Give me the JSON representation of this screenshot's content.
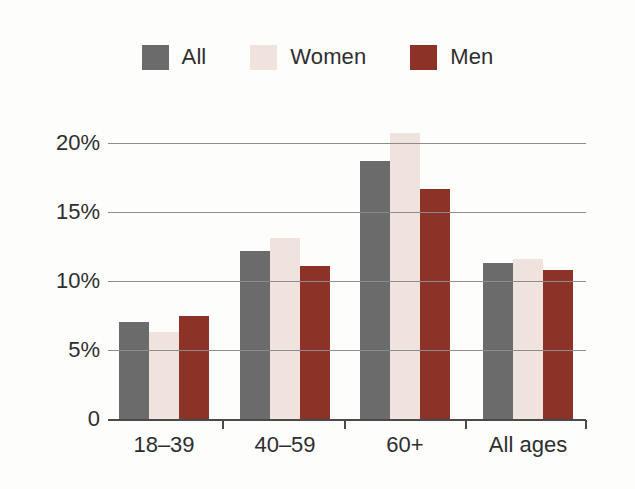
{
  "chart_data": {
    "type": "bar",
    "title": "",
    "subtitle": "",
    "xlabel": "",
    "ylabel": "",
    "categories": [
      "18–39",
      "40–59",
      "60+",
      "All ages"
    ],
    "series": [
      {
        "name": "All",
        "color": "#6b6b6b",
        "values": [
          7.0,
          12.2,
          18.7,
          11.3
        ]
      },
      {
        "name": "Women",
        "color": "#f0e3dd",
        "values": [
          6.3,
          13.1,
          20.7,
          11.6
        ]
      },
      {
        "name": "Men",
        "color": "#8d3227",
        "values": [
          7.5,
          11.1,
          16.7,
          10.8
        ]
      }
    ],
    "ylim": [
      0,
      21.5
    ],
    "yticks": [
      0,
      5,
      10,
      15,
      20
    ],
    "ytick_labels": [
      "0",
      "5%",
      "10%",
      "15%",
      "20%"
    ],
    "grid": "horizontal",
    "legend_position": "top-center",
    "value_format": "percent"
  },
  "legend": {
    "items": [
      {
        "label": "All",
        "swatch_color": "#6b6b6b",
        "icon": "legend-swatch-icon"
      },
      {
        "label": "Women",
        "swatch_color": "#f0e3dd",
        "icon": "legend-swatch-icon"
      },
      {
        "label": "Men",
        "swatch_color": "#8d3227",
        "icon": "legend-swatch-icon"
      }
    ]
  },
  "axes": {
    "y_tick_labels": [
      "20%",
      "15%",
      "10%",
      "5%",
      "0"
    ],
    "x_tick_labels": [
      "18–39",
      "40–59",
      "60+",
      "All ages"
    ]
  },
  "colors": {
    "background": "#fdfdfc",
    "gridline": "#8c8c8c",
    "axis": "#4a4a4a",
    "text": "#2e2e2e",
    "all": "#6b6b6b",
    "women": "#f0e3dd",
    "men": "#8d3227"
  }
}
